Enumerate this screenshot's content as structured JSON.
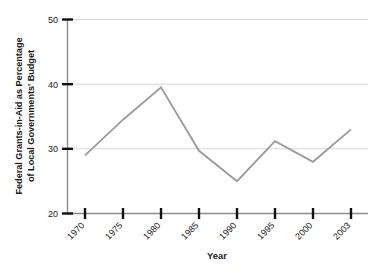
{
  "chart_data": {
    "type": "line",
    "title": "",
    "xlabel": "Year",
    "ylabel_line1": "Federal Grants-in-Aid as Percentage",
    "ylabel_line2": "of Local Governments' Budget",
    "ylabel": "Federal Grants-in-Aid as Percentage of Local Governments' Budget",
    "categories": [
      "1970",
      "1975",
      "1980",
      "1985",
      "1990",
      "1995",
      "2000",
      "2003"
    ],
    "x": [
      1970,
      1975,
      1980,
      1985,
      1990,
      1995,
      2000,
      2003
    ],
    "values": [
      29.0,
      34.5,
      39.5,
      29.7,
      25.0,
      31.2,
      28.0,
      33.0
    ],
    "series": [
      {
        "name": "Federal grants-in-aid share",
        "values": [
          29.0,
          34.5,
          39.5,
          29.7,
          25.0,
          31.2,
          28.0,
          33.0
        ]
      }
    ],
    "ylim": [
      20,
      50
    ],
    "yticks": [
      20,
      30,
      40,
      50
    ],
    "ytick_labels": [
      "20",
      "30",
      "40",
      "50"
    ],
    "xtick_labels": [
      "1970",
      "1975",
      "1980",
      "1985",
      "1990",
      "1995",
      "2000",
      "2003"
    ],
    "xtick_rotation_degrees": -45,
    "grid": "horizontal",
    "legend": "none",
    "colors": {
      "line": "#9a9a9a",
      "gridline": "#d9d9d9",
      "axis": "#8c8c8c",
      "tick_mark": "#111111",
      "text": "#1a1a1a",
      "background": "#ffffff"
    },
    "line_width": 1.8,
    "markers": "none"
  }
}
